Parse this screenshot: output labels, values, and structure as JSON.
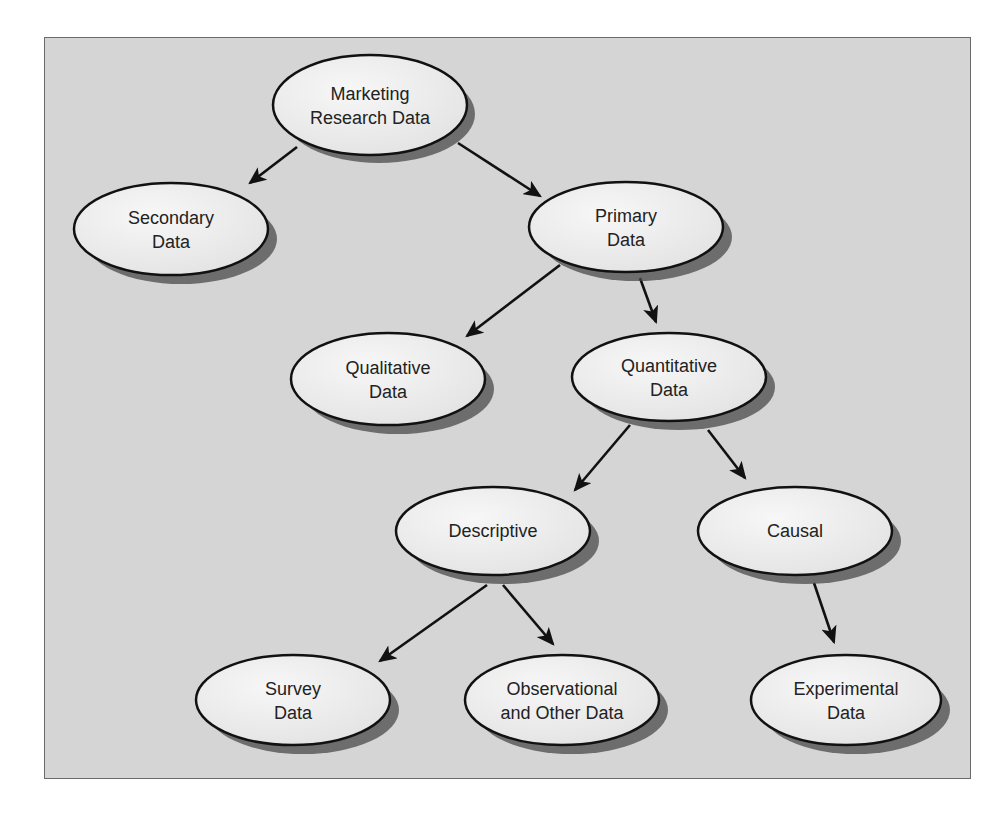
{
  "colors": {
    "background": "#d5d5d5",
    "frame_border": "#6a6a6a",
    "node_fill": "#f0f0f0",
    "node_stroke": "#111111",
    "shadow": "#555555",
    "text": "#222222"
  },
  "nodes": {
    "marketing": {
      "line1": "Marketing",
      "line2": "Research Data"
    },
    "secondary": {
      "line1": "Secondary",
      "line2": "Data"
    },
    "primary": {
      "line1": "Primary",
      "line2": "Data"
    },
    "qualitative": {
      "line1": "Qualitative",
      "line2": "Data"
    },
    "quantitative": {
      "line1": "Quantitative",
      "line2": "Data"
    },
    "descriptive": {
      "line1": "Descriptive"
    },
    "causal": {
      "line1": "Causal"
    },
    "survey": {
      "line1": "Survey",
      "line2": "Data"
    },
    "observational": {
      "line1": "Observational",
      "line2": "and Other Data"
    },
    "experimental": {
      "line1": "Experimental",
      "line2": "Data"
    }
  },
  "edges": [
    {
      "from": "Marketing Research Data",
      "to": "Secondary Data"
    },
    {
      "from": "Marketing Research Data",
      "to": "Primary Data"
    },
    {
      "from": "Primary Data",
      "to": "Qualitative Data"
    },
    {
      "from": "Primary Data",
      "to": "Quantitative Data"
    },
    {
      "from": "Quantitative Data",
      "to": "Descriptive"
    },
    {
      "from": "Quantitative Data",
      "to": "Causal"
    },
    {
      "from": "Descriptive",
      "to": "Survey Data"
    },
    {
      "from": "Descriptive",
      "to": "Observational and Other Data"
    },
    {
      "from": "Causal",
      "to": "Experimental Data"
    }
  ]
}
